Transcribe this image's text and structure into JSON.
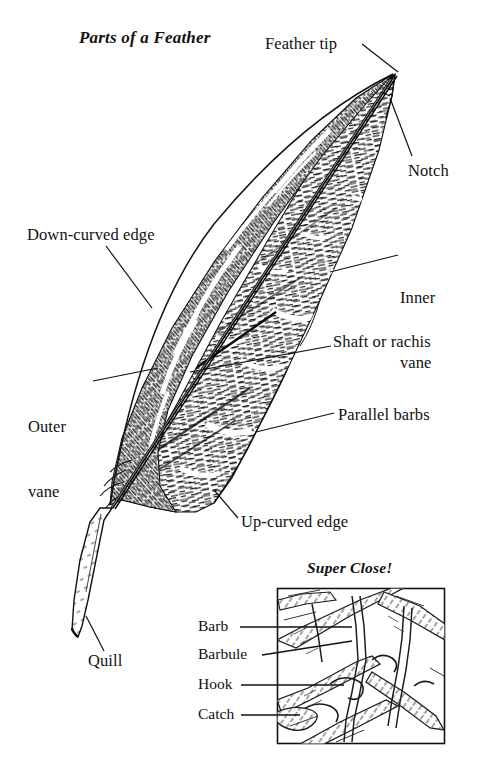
{
  "figure": {
    "title": "Parts of a Feather",
    "inset_title": "Super Close!",
    "style": "black-and-white pen-and-ink engraving",
    "background_color": "#ffffff",
    "ink_color": "#1a1a1a"
  },
  "labels": {
    "feather_tip": "Feather tip",
    "notch": "Notch",
    "down_curved_edge": "Down-curved edge",
    "inner_vane_line1": "Inner",
    "inner_vane_line2": "vane",
    "shaft_or_rachis": "Shaft or rachis",
    "outer_vane_line1": "Outer",
    "outer_vane_line2": "vane",
    "parallel_barbs": "Parallel barbs",
    "up_curved_edge": "Up-curved edge",
    "quill": "Quill"
  },
  "inset_labels": {
    "barb": "Barb",
    "barbule": "Barbule",
    "hook": "Hook",
    "catch": "Catch"
  }
}
